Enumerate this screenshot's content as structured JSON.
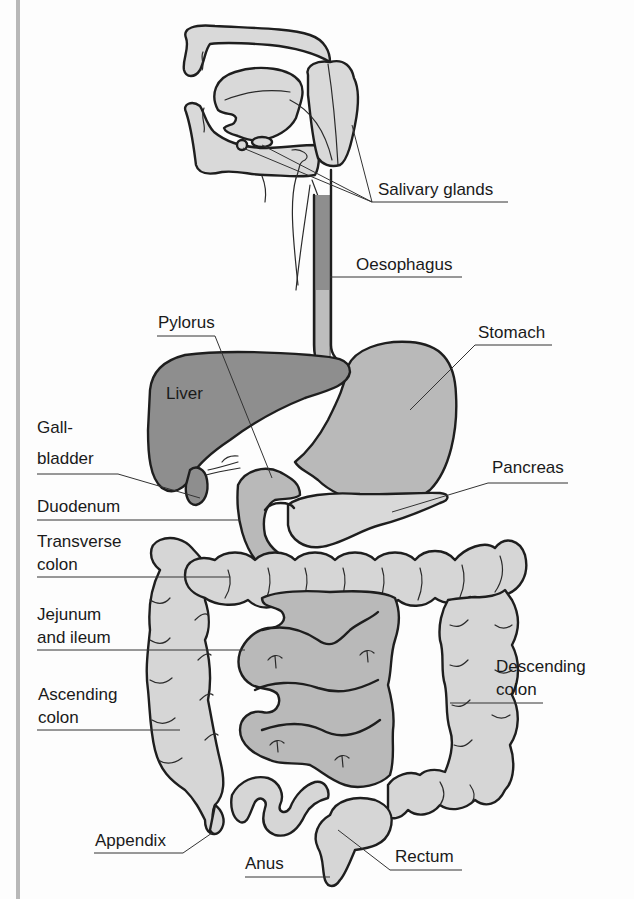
{
  "colors": {
    "background": "#fdfdfd",
    "outline": "#1e1e1e",
    "light_organ": "#d9d9d9",
    "mid_organ": "#b9b9b9",
    "dark_organ": "#8e8e8e",
    "frame_bar": "#b8b8b8"
  },
  "labels": {
    "salivary_glands": "Salivary glands",
    "oesophagus": "Oesophagus",
    "pylorus": "Pylorus",
    "stomach": "Stomach",
    "liver": "Liver",
    "gall_bladder_1": "Gall-",
    "gall_bladder_2": "bladder",
    "pancreas": "Pancreas",
    "duodenum": "Duodenum",
    "transverse_colon_1": "Transverse",
    "transverse_colon_2": "colon",
    "jejunum_1": "Jejunum",
    "jejunum_2": "and ileum",
    "ascending_colon_1": "Ascending",
    "ascending_colon_2": "colon",
    "descending_colon_1": "Descending",
    "descending_colon_2": "colon",
    "appendix": "Appendix",
    "anus": "Anus",
    "rectum": "Rectum"
  }
}
